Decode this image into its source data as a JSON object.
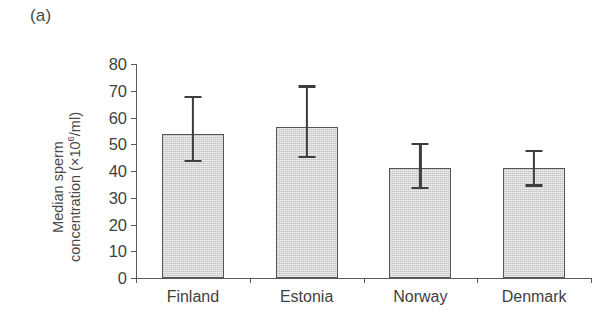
{
  "panel": {
    "label": "(a)"
  },
  "chart_data": {
    "type": "bar",
    "title": "(a)",
    "xlabel": "",
    "ylabel": "Median sperm concentration (×10⁶/ml)",
    "ylabel_line1": "Median sperm",
    "ylabel_line2_prefix": "concentration (×10",
    "ylabel_line2_exponent": "6",
    "ylabel_line2_suffix": "/ml)",
    "categories": [
      "Finland",
      "Estonia",
      "Norway",
      "Denmark"
    ],
    "values": [
      54,
      56.5,
      41,
      41
    ],
    "error_low": [
      44,
      45.5,
      34,
      35
    ],
    "error_high": [
      68,
      72,
      50.5,
      48
    ],
    "ylim": [
      0,
      80
    ],
    "yticks": [
      0,
      10,
      20,
      30,
      40,
      50,
      60,
      70,
      80
    ],
    "ytick_labels": [
      "0",
      "10",
      "20",
      "30",
      "40",
      "50",
      "60",
      "70",
      "80"
    ],
    "grid": false,
    "legend": null,
    "bar_fill_color": "#d6d6d6",
    "bar_edge_color": "#555555",
    "error_bar_color": "#3d3d3d",
    "axis_color": "#5a5a5a",
    "text_color": "#3f3f3f",
    "background_color": "#ffffff"
  }
}
